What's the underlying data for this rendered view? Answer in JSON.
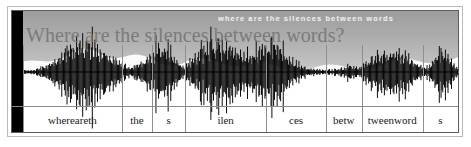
{
  "figure": {
    "title_overlay": "Where are the silences between words?",
    "caption_overlay": "where are the silences between words",
    "background_color": "#ffffff",
    "frame_color": "#5d5d5d",
    "outer_frame_color": "#b9b9b9",
    "band_color": "#a9a9a9",
    "waveform_color": "#000000",
    "boundary_color": "#8f8f8f"
  },
  "segmentation": {
    "tier_name": "phonetic-segmentation",
    "segments": [
      {
        "label": "whereareth",
        "start_pct": 2.5,
        "end_pct": 24.6
      },
      {
        "label": "the",
        "start_pct": 24.6,
        "end_pct": 31.4
      },
      {
        "label": "s",
        "start_pct": 31.4,
        "end_pct": 38.8
      },
      {
        "label": "ilen",
        "start_pct": 38.8,
        "end_pct": 57.0
      },
      {
        "label": "ces",
        "start_pct": 57.0,
        "end_pct": 70.4
      },
      {
        "label": "betw",
        "start_pct": 70.4,
        "end_pct": 78.4
      },
      {
        "label": "tweenword",
        "start_pct": 78.4,
        "end_pct": 92.1
      },
      {
        "label": "s",
        "start_pct": 92.1,
        "end_pct": 100.0
      }
    ]
  },
  "chart_data": {
    "type": "line",
    "title": "Where are the silences between words?",
    "xlabel": "",
    "ylabel": "",
    "legend": [],
    "grid": false,
    "ylim": [
      -1,
      1
    ],
    "xlim": [
      0,
      100
    ],
    "categories": [
      "whereareth",
      "the",
      "s",
      "ilen",
      "ces",
      "betw",
      "tweenword",
      "s"
    ],
    "values": [
      0.92,
      0.48,
      0.72,
      0.8,
      0.86,
      0.18,
      0.62,
      0.55
    ],
    "series": [
      {
        "name": "waveform-envelope",
        "x": [
          2.5,
          5,
          7,
          9,
          11,
          13,
          15,
          17,
          19,
          21,
          23,
          25,
          27,
          29,
          31,
          33,
          35,
          37,
          39,
          41,
          43,
          45,
          47,
          49,
          51,
          53,
          55,
          57,
          59,
          61,
          63,
          65,
          67,
          69,
          71,
          73,
          75,
          77,
          79,
          81,
          83,
          85,
          87,
          89,
          91,
          93,
          95,
          97,
          100
        ],
        "values": [
          0.05,
          0.18,
          0.3,
          0.55,
          0.88,
          0.92,
          0.85,
          0.7,
          0.52,
          0.35,
          0.22,
          0.12,
          0.28,
          0.44,
          0.72,
          0.6,
          0.3,
          0.14,
          0.4,
          0.66,
          0.78,
          0.8,
          0.74,
          0.62,
          0.5,
          0.58,
          0.72,
          0.86,
          0.7,
          0.38,
          0.2,
          0.12,
          0.08,
          0.06,
          0.05,
          0.1,
          0.16,
          0.12,
          0.3,
          0.42,
          0.5,
          0.62,
          0.58,
          0.4,
          0.2,
          0.1,
          0.46,
          0.55,
          0.08
        ]
      }
    ]
  }
}
